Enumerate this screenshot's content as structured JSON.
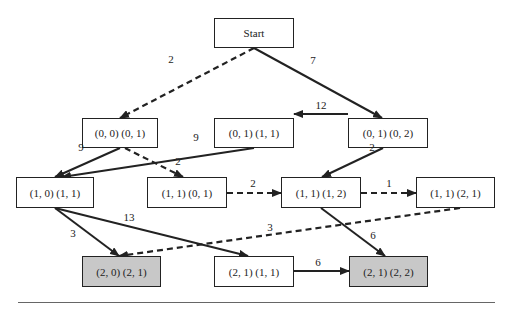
{
  "diagram": {
    "nodes": [
      {
        "id": "start",
        "label": "Start",
        "x": 214,
        "y": 18,
        "w": 80,
        "h": 30,
        "goal": false
      },
      {
        "id": "n00_01",
        "label": "(0, 0) (0, 1)",
        "x": 82,
        "y": 118,
        "w": 76,
        "h": 30,
        "goal": false
      },
      {
        "id": "n01_11",
        "label": "(0, 1) (1, 1)",
        "x": 214,
        "y": 118,
        "w": 80,
        "h": 30,
        "goal": false
      },
      {
        "id": "n01_02",
        "label": "(0, 1) (0, 2)",
        "x": 348,
        "y": 118,
        "w": 80,
        "h": 30,
        "goal": false
      },
      {
        "id": "n10_11",
        "label": "(1, 0) (1, 1)",
        "x": 16,
        "y": 177,
        "w": 78,
        "h": 31,
        "goal": false
      },
      {
        "id": "n11_01",
        "label": "(1, 1) (0, 1)",
        "x": 147,
        "y": 177,
        "w": 80,
        "h": 31,
        "goal": false
      },
      {
        "id": "n11_12",
        "label": "(1, 1) (1, 2)",
        "x": 281,
        "y": 177,
        "w": 80,
        "h": 31,
        "goal": false
      },
      {
        "id": "n11_21",
        "label": "(1, 1) (2, 1)",
        "x": 416,
        "y": 177,
        "w": 79,
        "h": 31,
        "goal": false
      },
      {
        "id": "n20_21",
        "label": "(2, 0) (2, 1)",
        "x": 82,
        "y": 256,
        "w": 79,
        "h": 31,
        "goal": true
      },
      {
        "id": "n21_11",
        "label": "(2, 1) (1, 1)",
        "x": 214,
        "y": 256,
        "w": 80,
        "h": 31,
        "goal": false
      },
      {
        "id": "n21_22",
        "label": "(2, 1) (2, 2)",
        "x": 349,
        "y": 256,
        "w": 79,
        "h": 31,
        "goal": true
      }
    ],
    "edges": [
      {
        "from": "start",
        "to": "n00_01",
        "weight": "2",
        "style": "dashed",
        "x1": 254,
        "y1": 48,
        "x2": 120,
        "y2": 118,
        "lx": 171,
        "ly": 59
      },
      {
        "from": "start",
        "to": "n01_02",
        "weight": "7",
        "style": "solid",
        "x1": 254,
        "y1": 48,
        "x2": 382,
        "y2": 118,
        "lx": 313,
        "ly": 60
      },
      {
        "from": "n01_02",
        "to": "n01_11",
        "weight": "12",
        "style": "solid",
        "x1": 348,
        "y1": 114,
        "x2": 294,
        "y2": 114,
        "lx": 321,
        "ly": 105
      },
      {
        "from": "n00_01",
        "to": "n10_11",
        "weight": "9",
        "style": "solid",
        "x1": 120,
        "y1": 148,
        "x2": 55,
        "y2": 177,
        "lx": 81,
        "ly": 147
      },
      {
        "from": "n00_01",
        "to": "n11_01",
        "weight": "2",
        "style": "dashed",
        "x1": 125,
        "y1": 148,
        "x2": 183,
        "y2": 177,
        "lx": 178,
        "ly": 161
      },
      {
        "from": "n01_11",
        "to": "n10_11",
        "weight": "9",
        "style": "solid",
        "x1": 254,
        "y1": 148,
        "x2": 62,
        "y2": 177,
        "lx": 196,
        "ly": 137
      },
      {
        "from": "n01_02",
        "to": "n11_12",
        "weight": "2",
        "style": "solid",
        "x1": 383,
        "y1": 148,
        "x2": 322,
        "y2": 177,
        "lx": 372,
        "ly": 147
      },
      {
        "from": "n11_01",
        "to": "n11_12",
        "weight": "2",
        "style": "dashed",
        "x1": 227,
        "y1": 193,
        "x2": 281,
        "y2": 193,
        "lx": 253,
        "ly": 183
      },
      {
        "from": "n11_12",
        "to": "n11_21",
        "weight": "1",
        "style": "dashed",
        "x1": 361,
        "y1": 193,
        "x2": 416,
        "y2": 193,
        "lx": 389,
        "ly": 183
      },
      {
        "from": "n10_11",
        "to": "n20_21",
        "weight": "3",
        "style": "solid",
        "x1": 55,
        "y1": 208,
        "x2": 119,
        "y2": 256,
        "lx": 73,
        "ly": 233
      },
      {
        "from": "n10_11",
        "to": "n21_11",
        "weight": "13",
        "style": "solid",
        "x1": 55,
        "y1": 208,
        "x2": 248,
        "y2": 256,
        "lx": 129,
        "ly": 217
      },
      {
        "from": "n11_21",
        "to": "n20_21",
        "weight": "3",
        "style": "dashed",
        "x1": 460,
        "y1": 208,
        "x2": 119,
        "y2": 256,
        "lx": 270,
        "ly": 227
      },
      {
        "from": "n11_12",
        "to": "n21_22",
        "weight": "6",
        "style": "solid",
        "x1": 321,
        "y1": 208,
        "x2": 385,
        "y2": 256,
        "lx": 373,
        "ly": 235
      },
      {
        "from": "n21_11",
        "to": "n21_22",
        "weight": "6",
        "style": "solid",
        "x1": 294,
        "y1": 271,
        "x2": 349,
        "y2": 271,
        "lx": 318,
        "ly": 262
      }
    ],
    "colors": {
      "stroke": "#222222",
      "goal_fill": "#c8c8c8",
      "node_fill": "#ffffff",
      "rule": "#666666"
    }
  }
}
